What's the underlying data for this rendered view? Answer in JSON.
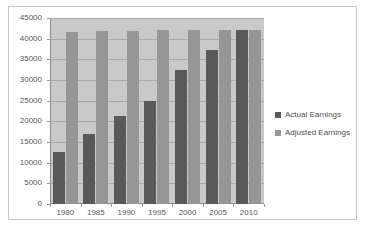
{
  "chart_data": {
    "type": "bar",
    "title": "",
    "subtitle": "",
    "xlabel": "",
    "ylabel": "",
    "categories": [
      "1980",
      "1985",
      "1990",
      "1995",
      "2000",
      "2005",
      "2010"
    ],
    "series": [
      {
        "name": "Actual Earnings",
        "color": "#595959",
        "values": [
          12500,
          17000,
          21200,
          25000,
          32500,
          37200,
          42000
        ]
      },
      {
        "name": "Adjusted Earnings",
        "color": "#969696",
        "values": [
          41700,
          41800,
          41900,
          42000,
          42000,
          42000,
          42000
        ]
      }
    ],
    "ylim": [
      0,
      45000
    ],
    "ytick_step": 5000,
    "yticks": [
      0,
      5000,
      10000,
      15000,
      20000,
      25000,
      30000,
      35000,
      40000,
      45000
    ],
    "ytick_labels": [
      "0",
      "5000",
      "10000",
      "15000",
      "20000",
      "25000",
      "30000",
      "35000",
      "40000",
      "45000"
    ],
    "grid": true,
    "grid_axis": "y",
    "legend_position": "right",
    "plot_background": "#c9c9c9",
    "figure_background": "#ffffff",
    "frame_border_color": "#c9c9c9"
  },
  "legend": {
    "entries": [
      {
        "label": "Actual Earnings",
        "swatch": "legend-swatch-actual"
      },
      {
        "label": "Adjusted Earnings",
        "swatch": "legend-swatch-adjusted"
      }
    ]
  }
}
